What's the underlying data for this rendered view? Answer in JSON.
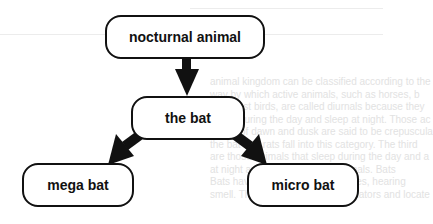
{
  "diagram": {
    "type": "hierarchy",
    "nodes": {
      "root": {
        "id": "root",
        "label": "nocturnal animal"
      },
      "bat": {
        "id": "bat",
        "label": "the bat"
      },
      "mega": {
        "id": "mega",
        "label": "mega bat"
      },
      "micro": {
        "id": "micro",
        "label": "micro bat"
      }
    },
    "edges": [
      {
        "from": "root",
        "to": "bat"
      },
      {
        "from": "bat",
        "to": "mega"
      },
      {
        "from": "bat",
        "to": "micro"
      }
    ],
    "colors": {
      "stroke": "#111111",
      "fill": "#ffffff",
      "background_text": "#e2e2e2"
    }
  },
  "background_text": {
    "lines": [
      "animal kingdom can be classified according to the",
      "way by which active animals, such as horses, b",
      "and most birds, are called diurnals because they",
      "active during the day and sleep at night. Those ac",
      "a time of dawn and dusk are said to be crepuscula",
      "the bat and rats fall into this category. The third",
      "are those animals that sleep during the day and a",
      "at night are called nocturnal animals. Bats",
      "Bats have highly developed senses, hearing",
      "smell. This helps them avoid predators and locate"
    ]
  }
}
